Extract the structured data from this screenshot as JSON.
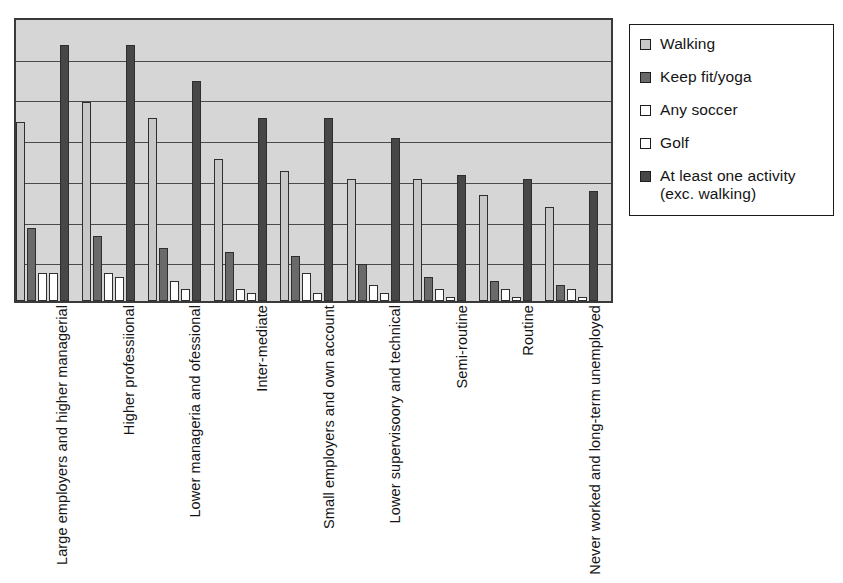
{
  "chart_data": {
    "type": "bar",
    "title": "",
    "xlabel": "",
    "ylabel": "",
    "ylim": [
      0,
      70
    ],
    "grid": true,
    "legend_position": "right",
    "categories": [
      "Large employers and higher managerial",
      "Higher professiional",
      "Lower manageria and ofessional",
      "Inter-mediate",
      "Small employers and own account",
      "Lower supervisoory and technical",
      "Semi-routine",
      "Routine",
      "Never worked and long-term unemployed"
    ],
    "series": [
      {
        "name": "Walking",
        "color": "#c8c8c8",
        "values": [
          44,
          49,
          45,
          35,
          32,
          30,
          30,
          26,
          23
        ]
      },
      {
        "name": "Keep fit/yoga",
        "color": "#6a6a6a",
        "values": [
          18,
          16,
          13,
          12,
          11,
          9,
          6,
          5,
          4
        ]
      },
      {
        "name": "Any soccer",
        "color": "#ffffff",
        "values": [
          7,
          7,
          5,
          3,
          7,
          4,
          3,
          3,
          3
        ]
      },
      {
        "name": "Golf",
        "color": "#ffffff",
        "values": [
          7,
          6,
          3,
          2,
          2,
          2,
          1,
          1,
          1
        ]
      },
      {
        "name": "At least one activity (exc. walking)",
        "color": "#474747",
        "values": [
          63,
          63,
          54,
          45,
          45,
          40,
          31,
          30,
          27
        ]
      }
    ]
  },
  "legend": {
    "items": [
      {
        "label": "Walking",
        "swatch": "legend-swatch-walking"
      },
      {
        "label": "Keep fit/yoga",
        "swatch": "legend-swatch-keepfit"
      },
      {
        "label": "Any soccer",
        "swatch": "legend-swatch-soccer"
      },
      {
        "label": "Golf",
        "swatch": "legend-swatch-golf"
      },
      {
        "label": "At least one activity\n(exc. walking)",
        "swatch": "legend-swatch-atleastone"
      }
    ]
  },
  "colors": {
    "plot_background": "#d6d6d6",
    "axis": "#3a3a3a",
    "gridline": "#4a4a4a",
    "bar_outline": "#2e2e2e"
  }
}
